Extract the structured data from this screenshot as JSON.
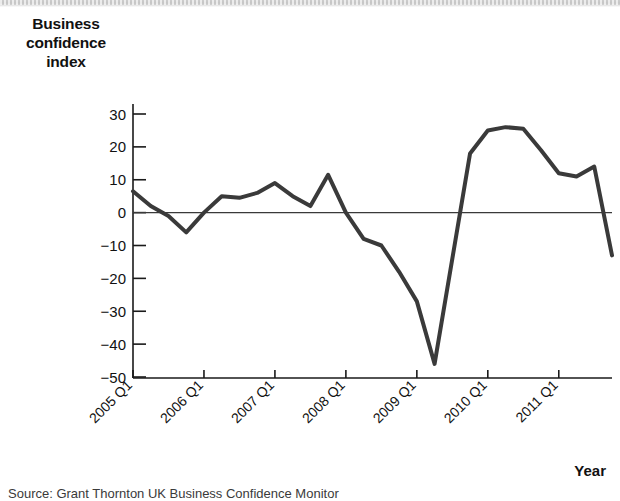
{
  "figure": {
    "y_axis_title": "Business confidence index",
    "y_axis_title_lines": [
      "Business",
      "confidence",
      "index"
    ],
    "x_axis_title": "Year",
    "source_note": "Source: Grant Thornton UK Business Confidence Monitor"
  },
  "chart_data": {
    "type": "line",
    "title": "",
    "subtitle": "",
    "xlabel": "Year",
    "ylabel": "Business confidence index",
    "grid": false,
    "legend": "none",
    "zero_line": true,
    "ylim": [
      -50,
      35
    ],
    "yticks": [
      30,
      20,
      10,
      0,
      -10,
      -20,
      -30,
      -40,
      -50
    ],
    "ytick_labels": [
      "30",
      "20",
      "10",
      "0",
      "−10",
      "−20",
      "−30",
      "−40",
      "−50"
    ],
    "xtick_labels": [
      "2005 Q1",
      "2006 Q1",
      "2007 Q1",
      "2008 Q1",
      "2009 Q1",
      "2010 Q1",
      "2011 Q1"
    ],
    "xtick_quarters": [
      0,
      4,
      8,
      12,
      16,
      20,
      24
    ],
    "xlim_quarters": [
      0,
      27
    ],
    "line_color": "#3a3a3a",
    "line_width": 4,
    "series": [
      {
        "name": "Business confidence index",
        "x": [
          "2005 Q1",
          "2005 Q2",
          "2005 Q3",
          "2005 Q4",
          "2006 Q1",
          "2006 Q2",
          "2006 Q3",
          "2006 Q4",
          "2007 Q1",
          "2007 Q2",
          "2007 Q3",
          "2007 Q4",
          "2008 Q1",
          "2008 Q2",
          "2008 Q3",
          "2008 Q4",
          "2009 Q1",
          "2009 Q2",
          "2009 Q3",
          "2009 Q4",
          "2010 Q1",
          "2010 Q2",
          "2010 Q3",
          "2010 Q4",
          "2011 Q1",
          "2011 Q2",
          "2011 Q3",
          "2011 Q4"
        ],
        "values": [
          6.5,
          2,
          -1,
          -6,
          0,
          5,
          4.5,
          6,
          9,
          5,
          2,
          11.5,
          0,
          -8,
          -10,
          -18,
          -27,
          -46,
          -14,
          18,
          25,
          26,
          25.5,
          19,
          12,
          11,
          14,
          -13
        ]
      }
    ]
  }
}
